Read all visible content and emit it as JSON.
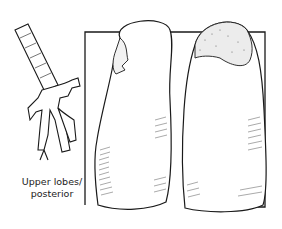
{
  "figure": {
    "label_line1": "Upper lobes/",
    "label_line2": "posterior",
    "ink_color": "#1a1a1a",
    "background": "#ffffff",
    "parts": [
      "trachea-bronchial-tree",
      "left-lung",
      "right-lung",
      "backdrop-rectangle"
    ]
  }
}
